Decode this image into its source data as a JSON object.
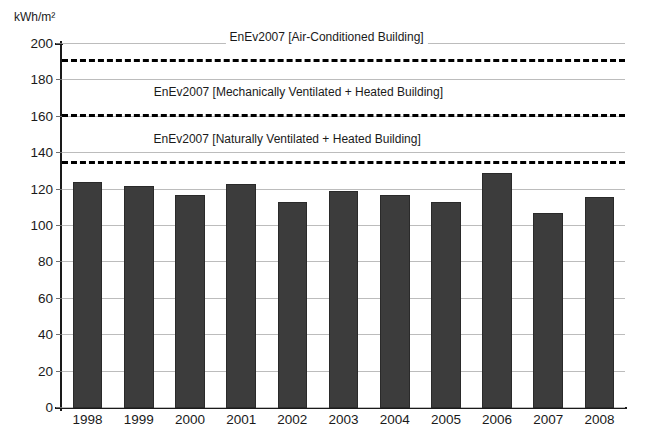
{
  "chart_data": {
    "type": "bar",
    "title": "",
    "subtitle": "",
    "xlabel": "",
    "ylabel": "kWh/m²",
    "ylim": [
      0,
      200
    ],
    "ytick_step": 20,
    "yticks": [
      0,
      20,
      40,
      60,
      80,
      100,
      120,
      140,
      160,
      180,
      200
    ],
    "grid": true,
    "legend": "none",
    "categories": [
      "1998",
      "1999",
      "2000",
      "2001",
      "2002",
      "2003",
      "2004",
      "2005",
      "2006",
      "2007",
      "2008"
    ],
    "values": [
      124,
      122,
      117,
      123,
      113,
      119,
      117,
      113,
      129,
      107,
      116
    ],
    "series": [
      {
        "name": "Annual energy consumption",
        "values": [
          124,
          122,
          117,
          123,
          113,
          119,
          117,
          113,
          129,
          107,
          116
        ],
        "color": "#3c3c3c"
      }
    ],
    "reference_lines": [
      {
        "label": "EnEv2007 [Air-Conditioned Building]",
        "value": 190,
        "style": "dashed",
        "color": "#000000"
      },
      {
        "label": "EnEv2007 [Mechanically Ventilated + Heated Building]",
        "value": 160,
        "style": "dashed",
        "color": "#000000"
      },
      {
        "label": "EnEv2007 [Naturally Ventilated + Heated Building]",
        "value": 134,
        "style": "dashed",
        "color": "#000000"
      }
    ],
    "annotations": []
  },
  "colors": {
    "bar": "#3c3c3c",
    "bar_edge": "#2a2a2a",
    "grid": "#bcbcbc",
    "axis": "#1a1a1a",
    "reference_line": "#000000",
    "background": "#ffffff"
  },
  "bottom_caption": ""
}
